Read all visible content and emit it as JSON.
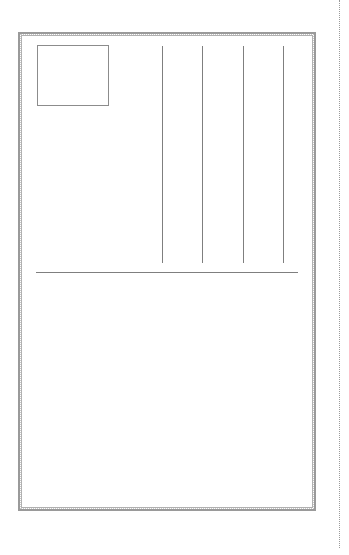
{
  "postcard": {
    "type": "postcard-back-template",
    "colors": {
      "frame": "#9a9a9a",
      "lines": "#7f7f7f",
      "background": "#ffffff"
    },
    "stamp_box": {
      "x": 37,
      "y": 45,
      "width": 72,
      "height": 61
    },
    "address_lines_x": [
      162,
      202,
      243,
      283
    ],
    "divider_y": 272,
    "cut_line_x": 339
  }
}
